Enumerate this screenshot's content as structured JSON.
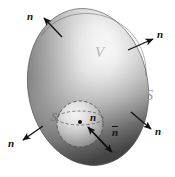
{
  "figure": {
    "canvas": {
      "width": 175,
      "height": 177,
      "background": "#ffffff"
    },
    "colors": {
      "highlight": "#fdfdfd",
      "midtone": "#c9c9c9",
      "shadow": "#6a6a6a",
      "deep_shadow": "#454545",
      "outline": "#3a3a3a",
      "arrow": "#111111",
      "label_V": "#b9b9b9",
      "label_S": "#999999",
      "label_Sprime": "#6e6e6e",
      "inner_sphere_light": "#f2f2f2",
      "inner_sphere_dark": "#7a7a7a",
      "dashed_line": "#4a4a4a"
    },
    "outer_surface": {
      "shape": "ellipsoid",
      "center": {
        "x": 88,
        "y": 87
      },
      "radius_x": 60,
      "radius_y": 79,
      "rotation_deg": -10,
      "label": "S",
      "label_position": {
        "x": 146,
        "y": 96
      }
    },
    "volume": {
      "label": "V",
      "label_position": {
        "x": 95,
        "y": 52
      }
    },
    "inner_surface": {
      "shape": "sphere",
      "center": {
        "x": 80,
        "y": 124
      },
      "radius": 23,
      "label": "S'",
      "label_position": {
        "x": 51,
        "y": 117
      },
      "center_dot": {
        "x": 80,
        "y": 122,
        "radius": 2
      },
      "equator_dashed": true
    },
    "normals": [
      {
        "id": "normal-top-left",
        "label": "n",
        "overbar": false,
        "label_position": {
          "x": 29,
          "y": 16
        },
        "arrow_from": {
          "x": 62,
          "y": 37
        },
        "arrow_to": {
          "x": 43,
          "y": 17
        }
      },
      {
        "id": "normal-top-right",
        "label": "n",
        "overbar": false,
        "label_position": {
          "x": 158,
          "y": 34
        },
        "arrow_from": {
          "x": 128,
          "y": 50
        },
        "arrow_to": {
          "x": 154,
          "y": 39
        }
      },
      {
        "id": "normal-bottom-right",
        "label": "n",
        "overbar": false,
        "label_position": {
          "x": 156,
          "y": 131
        },
        "arrow_from": {
          "x": 131,
          "y": 112
        },
        "arrow_to": {
          "x": 152,
          "y": 130
        }
      },
      {
        "id": "normal-bottom-left",
        "label": "n",
        "overbar": false,
        "label_position": {
          "x": 9,
          "y": 143
        },
        "arrow_from": {
          "x": 43,
          "y": 126
        },
        "arrow_to": {
          "x": 22,
          "y": 141
        }
      },
      {
        "id": "normal-inner-sphere",
        "label": "n",
        "overbar": false,
        "label_position": {
          "x": 91,
          "y": 117
        },
        "arrow_from": {
          "x": 111,
          "y": 152
        },
        "arrow_to": {
          "x": 87,
          "y": 126
        }
      },
      {
        "id": "normal-inner-outward",
        "label": "n",
        "overbar": true,
        "label_position": {
          "x": 113,
          "y": 131
        },
        "arrow_from": {
          "x": 89,
          "y": 128
        },
        "arrow_to": {
          "x": 113,
          "y": 153
        }
      }
    ]
  }
}
